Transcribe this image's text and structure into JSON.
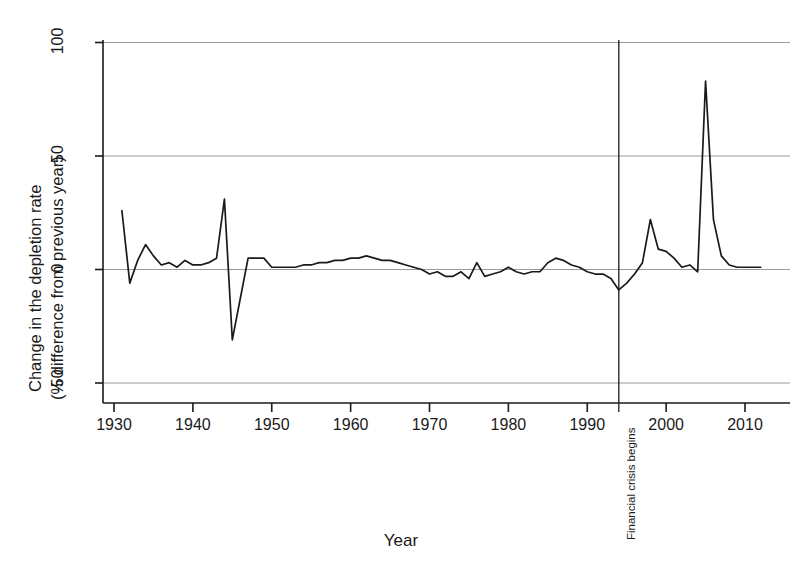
{
  "chart_data": {
    "type": "line",
    "title": "",
    "xlabel": "Year",
    "ylabel": "Change in the depletion rate\n(% difference from previous year)",
    "ylabel_line1": "Change in the depletion rate",
    "ylabel_line2": "(% difference from previous year)",
    "xlim": [
      1928,
      2013
    ],
    "ylim": [
      -58,
      108
    ],
    "xticks": [
      1930,
      1940,
      1950,
      1960,
      1970,
      1980,
      1990,
      2000,
      2010
    ],
    "xticklabels": [
      "1930",
      "1940",
      "1950",
      "1960",
      "1970",
      "1980",
      "1990",
      "2000",
      "2010"
    ],
    "yticks": [
      -50,
      0,
      50,
      100
    ],
    "yticklabels": [
      "-50",
      "0",
      "50",
      "100"
    ],
    "grid": "horizontal gridlines at -50, 0, 50, 100",
    "legend": "none",
    "line_color": "#1a1a1a",
    "grid_color": "#9a9a9a",
    "annotations": [
      {
        "name": "financial-crisis-marker",
        "text": "Financial crisis begins",
        "x": 1994,
        "orientation": "vertical-line-with-rotated-label"
      }
    ],
    "x": [
      1931,
      1932,
      1933,
      1934,
      1935,
      1936,
      1937,
      1938,
      1939,
      1940,
      1941,
      1942,
      1943,
      1944,
      1945,
      1946,
      1947,
      1948,
      1949,
      1950,
      1951,
      1952,
      1953,
      1954,
      1955,
      1956,
      1957,
      1958,
      1959,
      1960,
      1961,
      1962,
      1963,
      1964,
      1965,
      1966,
      1967,
      1968,
      1969,
      1970,
      1971,
      1972,
      1973,
      1974,
      1975,
      1976,
      1977,
      1978,
      1979,
      1980,
      1981,
      1982,
      1983,
      1984,
      1985,
      1986,
      1987,
      1988,
      1989,
      1990,
      1991,
      1992,
      1993,
      1994,
      1995,
      1996,
      1997,
      1998,
      1999,
      2000,
      2001,
      2002,
      2003,
      2004,
      2005,
      2006,
      2007,
      2008,
      2009,
      2010,
      2011,
      2012
    ],
    "values": [
      26,
      -6,
      4,
      11,
      6,
      2,
      3,
      1,
      4,
      2,
      2,
      3,
      5,
      31,
      -31,
      -13,
      5,
      5,
      5,
      1,
      1,
      1,
      1,
      2,
      2,
      3,
      3,
      4,
      4,
      5,
      5,
      6,
      5,
      4,
      4,
      3,
      2,
      1,
      0,
      -2,
      -1,
      -3,
      -3,
      -1,
      -4,
      3,
      -3,
      -2,
      -1,
      1,
      -1,
      -2,
      -1,
      -1,
      3,
      5,
      4,
      2,
      1,
      -1,
      -2,
      -2,
      -4,
      -9,
      -6,
      -2,
      3,
      22,
      9,
      8,
      5,
      1,
      2,
      -1,
      83,
      22,
      6,
      2,
      1,
      1,
      1,
      1
    ]
  },
  "axis": {
    "xlabel_text": "Year",
    "ylabel_line1_text": "Change in the depletion rate",
    "ylabel_line2_text": "(% difference from previous year)"
  },
  "annotation": {
    "crisis_text": "Financial crisis begins"
  }
}
